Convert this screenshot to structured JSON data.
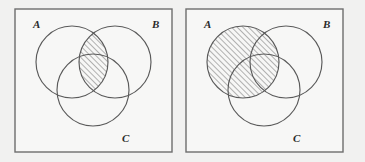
{
  "figure": {
    "background_color": "#f1f1f0",
    "panel_fill_color": "#f7f7f6",
    "frame_stroke_color": "#6d6d6d",
    "circle_stroke_color": "#5a5a5a",
    "hatch_color": "#5a5a5a",
    "hatch_angle_deg": 45,
    "hatch_direction": "bottom-left-to-top-right"
  },
  "panels": [
    {
      "id": "left-panel",
      "frame": {
        "x": 15,
        "y": 9,
        "width": 157,
        "height": 143
      },
      "circles": [
        {
          "id": "A",
          "label": "A",
          "cx": 72,
          "cy": 62,
          "r": 36,
          "label_x": 33,
          "label_y": 28
        },
        {
          "id": "B",
          "label": "B",
          "cx": 115,
          "cy": 62,
          "r": 36,
          "label_x": 152,
          "label_y": 28
        },
        {
          "id": "C",
          "label": "C",
          "cx": 93,
          "cy": 90,
          "r": 36,
          "label_x": 122,
          "label_y": 142
        }
      ],
      "shaded_region": {
        "name": "A-intersect-B",
        "description": "lens where circle A overlaps circle B",
        "fill": "hatched"
      }
    },
    {
      "id": "right-panel",
      "frame": {
        "x": 186,
        "y": 9,
        "width": 157,
        "height": 143
      },
      "circles": [
        {
          "id": "A",
          "label": "A",
          "cx": 243,
          "cy": 62,
          "r": 36,
          "label_x": 204,
          "label_y": 28
        },
        {
          "id": "B",
          "label": "B",
          "cx": 286,
          "cy": 62,
          "r": 36,
          "label_x": 323,
          "label_y": 28
        },
        {
          "id": "C",
          "label": "C",
          "cx": 264,
          "cy": 90,
          "r": 36,
          "label_x": 293,
          "label_y": 142
        }
      ],
      "shaded_region": {
        "name": "A",
        "description": "entire circle A",
        "fill": "hatched"
      }
    }
  ]
}
